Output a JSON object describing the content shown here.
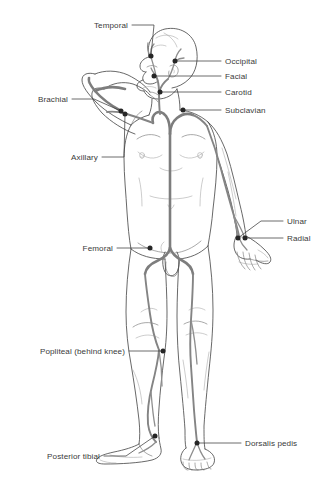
{
  "diagram": {
    "colors": {
      "outline": "#4a4a4a",
      "artery": "#7d7d7d",
      "dot": "#2b2b2b",
      "leader": "#3c3c3c",
      "text": "#3a3a3a",
      "background": "#ffffff"
    }
  },
  "labels": [
    {
      "id": "temporal",
      "text": "Temporal",
      "side": "left",
      "text_x": 128,
      "text_y": 25,
      "point_x": 151,
      "point_y": 56
    },
    {
      "id": "occipital",
      "text": "Occipital",
      "side": "right",
      "text_x": 225,
      "text_y": 61,
      "point_x": 175,
      "point_y": 61
    },
    {
      "id": "facial",
      "text": "Facial",
      "side": "right",
      "text_x": 225,
      "text_y": 76,
      "point_x": 154,
      "point_y": 76
    },
    {
      "id": "carotid",
      "text": "Carotid",
      "side": "right",
      "text_x": 225,
      "text_y": 92,
      "point_x": 160,
      "point_y": 92
    },
    {
      "id": "subclavian",
      "text": "Subclavian",
      "side": "right",
      "text_x": 225,
      "text_y": 110,
      "point_x": 183,
      "point_y": 110
    },
    {
      "id": "brachial",
      "text": "Brachial",
      "side": "left",
      "text_x": 68,
      "text_y": 99,
      "point_x": 121,
      "point_y": 111
    },
    {
      "id": "axillary",
      "text": "Axillary",
      "side": "left",
      "text_x": 98,
      "text_y": 157,
      "point_x": 125,
      "point_y": 114
    },
    {
      "id": "ulnar",
      "text": "Ulnar",
      "side": "right",
      "text_x": 287,
      "text_y": 221,
      "point_x": 238,
      "point_y": 238
    },
    {
      "id": "radial",
      "text": "Radial",
      "side": "right",
      "text_x": 287,
      "text_y": 238,
      "point_x": 245,
      "point_y": 238
    },
    {
      "id": "femoral",
      "text": "Femoral",
      "side": "left",
      "text_x": 113,
      "text_y": 248,
      "point_x": 150,
      "point_y": 248
    },
    {
      "id": "popliteal",
      "text": "Popliteal (behind knee)",
      "side": "left",
      "text_x": 125,
      "text_y": 351,
      "point_x": 163,
      "point_y": 351
    },
    {
      "id": "posterior-tibial",
      "text": "Posterior tibial",
      "side": "left",
      "text_x": 100,
      "text_y": 456,
      "point_x": 155,
      "point_y": 436
    },
    {
      "id": "dorsalis-pedis",
      "text": "Dorsalis pedis",
      "side": "right",
      "text_x": 245,
      "text_y": 443,
      "point_x": 197,
      "point_y": 443
    }
  ],
  "caption": {
    "text": ""
  }
}
